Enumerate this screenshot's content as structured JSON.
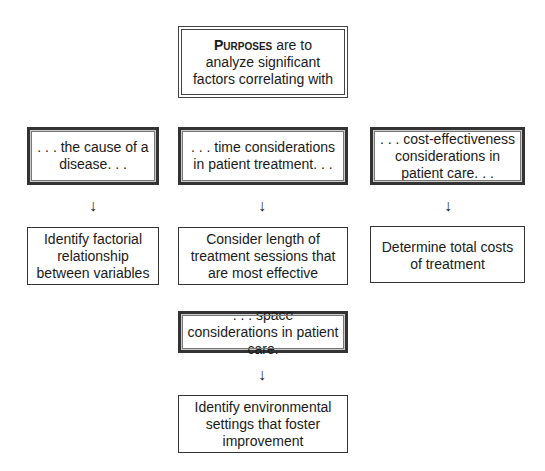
{
  "header": {
    "purposes_word": "Purposes",
    "text_after": " are to analyze significant factors correlating with"
  },
  "factors": [
    {
      "label": ". . . the cause of a disease. . ."
    },
    {
      "label": ". . . time considerations in patient treatment. . ."
    },
    {
      "label": ". . . cost-effectiveness considerations in patient care. . ."
    },
    {
      "label": ". . . space considerations in patient care."
    }
  ],
  "outcomes": [
    {
      "label": "Identify factorial relationship between variables"
    },
    {
      "label": "Consider length of treatment sessions that are most effective"
    },
    {
      "label": "Determine total costs of treatment"
    },
    {
      "label": "Identify environmental settings that foster improvement"
    }
  ],
  "arrow_glyph": "↓"
}
